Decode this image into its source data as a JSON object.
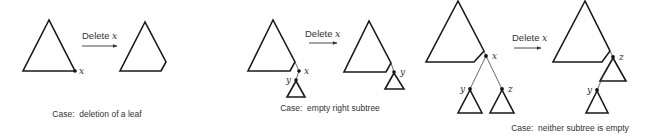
{
  "diagram": {
    "operation_label": "Delete ",
    "operation_var": "x",
    "panels": [
      {
        "caption": "Case:  deletion of a leaf",
        "before": {
          "nodes": [
            {
              "label": "x"
            }
          ]
        },
        "after": {
          "nodes": []
        }
      },
      {
        "caption": "Case:  empty right subtree",
        "before": {
          "nodes": [
            {
              "label": "x"
            },
            {
              "label": "y"
            }
          ]
        },
        "after": {
          "nodes": [
            {
              "label": "y"
            }
          ]
        }
      },
      {
        "caption": "Case:  neither subtree is empty",
        "before": {
          "nodes": [
            {
              "label": "x"
            },
            {
              "label": "y"
            },
            {
              "label": "z"
            }
          ]
        },
        "after": {
          "nodes": [
            {
              "label": "z"
            },
            {
              "label": "y"
            }
          ]
        }
      }
    ]
  }
}
